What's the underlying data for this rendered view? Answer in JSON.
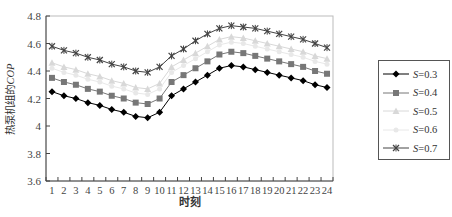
{
  "chart_data": {
    "type": "line",
    "title": "",
    "xlabel": "时刻",
    "ylabel": "热泵机组的COP",
    "ylabel_prefix": "热泵机组的",
    "ylabel_italic": "COP",
    "ylim": [
      3.6,
      4.8
    ],
    "yticks": [
      "3.6",
      "3.8",
      "4",
      "4.2",
      "4.4",
      "4.6",
      "4.8"
    ],
    "x": [
      1,
      2,
      3,
      4,
      5,
      6,
      7,
      8,
      9,
      10,
      11,
      12,
      13,
      14,
      15,
      16,
      17,
      18,
      19,
      20,
      21,
      22,
      23,
      24
    ],
    "grid": false,
    "legend_position": "right",
    "series": [
      {
        "name": "S=0.3",
        "marker": "diamond",
        "color": "#000000",
        "values": [
          4.25,
          4.22,
          4.2,
          4.17,
          4.15,
          4.12,
          4.1,
          4.07,
          4.06,
          4.1,
          4.22,
          4.27,
          4.32,
          4.37,
          4.42,
          4.44,
          4.43,
          4.41,
          4.39,
          4.37,
          4.35,
          4.33,
          4.3,
          4.28
        ]
      },
      {
        "name": "S=0.4",
        "marker": "square",
        "color": "#777777",
        "values": [
          4.35,
          4.32,
          4.3,
          4.27,
          4.25,
          4.22,
          4.2,
          4.17,
          4.16,
          4.2,
          4.32,
          4.37,
          4.42,
          4.47,
          4.52,
          4.54,
          4.53,
          4.51,
          4.49,
          4.47,
          4.45,
          4.43,
          4.4,
          4.38
        ]
      },
      {
        "name": "S=0.5",
        "marker": "triangle",
        "color": "#d8d8d8",
        "values": [
          4.46,
          4.43,
          4.41,
          4.38,
          4.36,
          4.33,
          4.31,
          4.28,
          4.27,
          4.31,
          4.43,
          4.48,
          4.53,
          4.58,
          4.63,
          4.65,
          4.64,
          4.62,
          4.6,
          4.58,
          4.56,
          4.54,
          4.51,
          4.49
        ]
      },
      {
        "name": "S=0.6",
        "marker": "dot",
        "color": "#e8e8e8",
        "values": [
          4.42,
          4.39,
          4.37,
          4.34,
          4.32,
          4.29,
          4.27,
          4.24,
          4.23,
          4.27,
          4.39,
          4.44,
          4.49,
          4.54,
          4.59,
          4.61,
          4.6,
          4.58,
          4.56,
          4.54,
          4.52,
          4.5,
          4.47,
          4.45
        ]
      },
      {
        "name": "S=0.7",
        "marker": "star",
        "color": "#444444",
        "values": [
          4.58,
          4.55,
          4.53,
          4.5,
          4.48,
          4.45,
          4.43,
          4.4,
          4.39,
          4.43,
          4.51,
          4.56,
          4.62,
          4.67,
          4.71,
          4.73,
          4.72,
          4.71,
          4.69,
          4.67,
          4.65,
          4.63,
          4.6,
          4.57
        ]
      }
    ]
  },
  "legend": {
    "items": [
      {
        "prefix": "S",
        "value": "=0.3"
      },
      {
        "prefix": "S",
        "value": "=0.4"
      },
      {
        "prefix": "S",
        "value": "=0.5"
      },
      {
        "prefix": "S",
        "value": "=0.6"
      },
      {
        "prefix": "S",
        "value": "=0.7"
      }
    ]
  }
}
